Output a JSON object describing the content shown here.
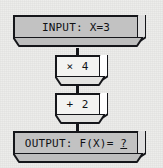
{
  "diagram": {
    "background_color": "#ececea",
    "ink_color": "#15161a",
    "bar_fill": "#c2c2c2",
    "op_fill": "#f3f3f1",
    "input": {
      "label": "INPUT: X=3",
      "variable": "X",
      "value": "3"
    },
    "operations": [
      {
        "id": "multiply",
        "label": "× 4",
        "operator": "×",
        "operand": "4"
      },
      {
        "id": "add",
        "label": "+ 2",
        "operator": "+",
        "operand": "2"
      }
    ],
    "output": {
      "label_prefix": "OUTPUT: F(X)= ",
      "value": "?"
    },
    "connectors": [
      {
        "from": "input",
        "to": "multiply",
        "icon": "down-arrow-icon"
      },
      {
        "from": "multiply",
        "to": "add",
        "icon": "down-arrow-icon"
      },
      {
        "from": "add",
        "to": "output",
        "icon": "down-arrow-icon"
      }
    ]
  }
}
